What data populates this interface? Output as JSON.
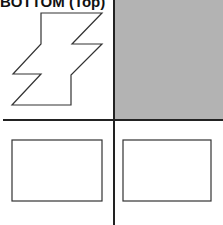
{
  "title": "BOTTOM (Top)",
  "colors": {
    "quadrant_fill": "#b3b3b3",
    "line": "#333333",
    "divider": "#222222"
  },
  "quadrants": [
    {
      "position": "top-left",
      "content": "zigzag-shape"
    },
    {
      "position": "top-right",
      "content": "gray-filled"
    },
    {
      "position": "bottom-left",
      "content": "rectangle"
    },
    {
      "position": "bottom-right",
      "content": "rectangle"
    }
  ]
}
